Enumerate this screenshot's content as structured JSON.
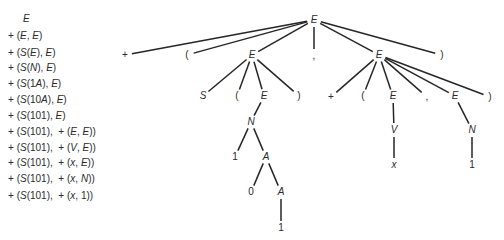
{
  "derivation": {
    "lines": [
      {
        "text": "E",
        "y": 19,
        "x": 23
      },
      {
        "text": "+ (E, E)",
        "y": 36,
        "x": 8
      },
      {
        "text": "+ (S(E), E)",
        "y": 53,
        "x": 8
      },
      {
        "text": "+ (S(N), E)",
        "y": 68,
        "x": 8
      },
      {
        "text": "+ (S(1A), E)",
        "y": 84,
        "x": 8
      },
      {
        "text": "+ (S(10A), E)",
        "y": 100,
        "x": 8
      },
      {
        "text": "+ (S(101), E)",
        "y": 116,
        "x": 8
      },
      {
        "text": "+ (S(101),  + (E, E))",
        "y": 132,
        "x": 8
      },
      {
        "text": "+ (S(101),  + (V, E))",
        "y": 148,
        "x": 8
      },
      {
        "text": "+ (S(101),  + (x, E))",
        "y": 163,
        "x": 8
      },
      {
        "text": "+ (S(101),  + (x, N))",
        "y": 179,
        "x": 8
      },
      {
        "text": "+ (S(101),  + (x, 1))",
        "y": 196,
        "x": 8
      }
    ]
  },
  "tree": {
    "line_color": "#262626",
    "nodes": [
      {
        "id": "root",
        "label": "E",
        "x": 314,
        "y": 20,
        "italic": true
      },
      {
        "id": "plus1",
        "label": "+",
        "x": 125,
        "y": 55,
        "italic": false
      },
      {
        "id": "lp1",
        "label": "(",
        "x": 187,
        "y": 55,
        "italic": false
      },
      {
        "id": "E1",
        "label": "E",
        "x": 252,
        "y": 55,
        "italic": true
      },
      {
        "id": "comma1",
        "label": ",",
        "x": 314,
        "y": 56,
        "italic": false
      },
      {
        "id": "E2",
        "label": "E",
        "x": 379,
        "y": 55,
        "italic": true
      },
      {
        "id": "rp1",
        "label": ")",
        "x": 442,
        "y": 55,
        "italic": false
      },
      {
        "id": "S",
        "label": "S",
        "x": 203,
        "y": 96,
        "italic": true
      },
      {
        "id": "lp2",
        "label": "(",
        "x": 237,
        "y": 96,
        "italic": false
      },
      {
        "id": "E3",
        "label": "E",
        "x": 264,
        "y": 96,
        "italic": true
      },
      {
        "id": "rp2",
        "label": ")",
        "x": 299,
        "y": 96,
        "italic": false
      },
      {
        "id": "N1",
        "label": "N",
        "x": 251,
        "y": 122,
        "italic": true
      },
      {
        "id": "one1",
        "label": "1",
        "x": 235,
        "y": 157,
        "italic": false
      },
      {
        "id": "A1",
        "label": "A",
        "x": 266,
        "y": 157,
        "italic": true
      },
      {
        "id": "zero",
        "label": "0",
        "x": 251,
        "y": 192,
        "italic": false
      },
      {
        "id": "A2",
        "label": "A",
        "x": 281,
        "y": 192,
        "italic": true
      },
      {
        "id": "one2",
        "label": "1",
        "x": 281,
        "y": 228,
        "italic": false
      },
      {
        "id": "plus2",
        "label": "+",
        "x": 331,
        "y": 97,
        "italic": false
      },
      {
        "id": "lp3",
        "label": "(",
        "x": 363,
        "y": 96,
        "italic": false
      },
      {
        "id": "E4",
        "label": "E",
        "x": 393,
        "y": 96,
        "italic": true
      },
      {
        "id": "comma2",
        "label": ",",
        "x": 427,
        "y": 97,
        "italic": false
      },
      {
        "id": "E5",
        "label": "E",
        "x": 455,
        "y": 96,
        "italic": true
      },
      {
        "id": "rp3",
        "label": ")",
        "x": 490,
        "y": 97,
        "italic": false
      },
      {
        "id": "V",
        "label": "V",
        "x": 394,
        "y": 130,
        "italic": true
      },
      {
        "id": "x",
        "label": "x",
        "x": 394,
        "y": 165,
        "italic": true
      },
      {
        "id": "N2",
        "label": "N",
        "x": 472,
        "y": 130,
        "italic": true
      },
      {
        "id": "one3",
        "label": "1",
        "x": 472,
        "y": 165,
        "italic": false
      }
    ],
    "edges": [
      [
        "root",
        "plus1"
      ],
      [
        "root",
        "lp1"
      ],
      [
        "root",
        "E1"
      ],
      [
        "root",
        "comma1"
      ],
      [
        "root",
        "E2"
      ],
      [
        "root",
        "rp1"
      ],
      [
        "E1",
        "S"
      ],
      [
        "E1",
        "lp2"
      ],
      [
        "E1",
        "E3"
      ],
      [
        "E1",
        "rp2"
      ],
      [
        "E3",
        "N1"
      ],
      [
        "N1",
        "one1"
      ],
      [
        "N1",
        "A1"
      ],
      [
        "A1",
        "zero"
      ],
      [
        "A1",
        "A2"
      ],
      [
        "A2",
        "one2"
      ],
      [
        "E2",
        "plus2"
      ],
      [
        "E2",
        "lp3"
      ],
      [
        "E2",
        "E4"
      ],
      [
        "E2",
        "comma2"
      ],
      [
        "E2",
        "E5"
      ],
      [
        "E2",
        "rp3"
      ],
      [
        "E4",
        "V"
      ],
      [
        "V",
        "x"
      ],
      [
        "E5",
        "N2"
      ],
      [
        "N2",
        "one3"
      ]
    ]
  }
}
